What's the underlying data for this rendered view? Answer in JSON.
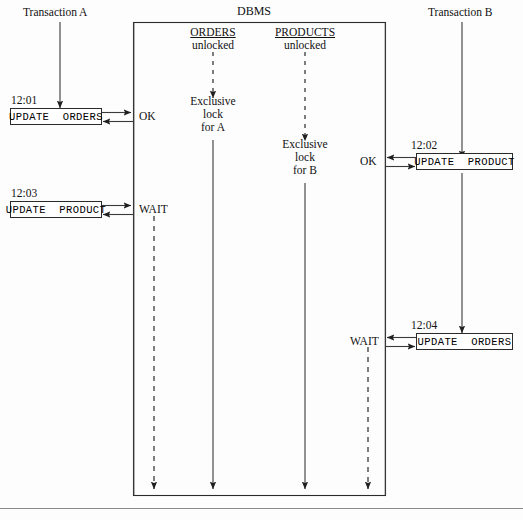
{
  "diagram": {
    "dbms_label": "DBMS",
    "actors": {
      "left": "Transaction A",
      "right": "Transaction B"
    },
    "resources": [
      {
        "name": "ORDERS",
        "initial_state": "unlocked",
        "final_state_line1": "Exclusive",
        "final_state_line2": "lock",
        "final_state_line3": "for A"
      },
      {
        "name": "PRODUCTS",
        "initial_state": "unlocked",
        "final_state_line1": "Exclusive",
        "final_state_line2": "lock",
        "final_state_line3": "for B"
      }
    ],
    "events": [
      {
        "time": "12:01",
        "statement": "UPDATE  ORDERS",
        "response": "OK",
        "side": "left"
      },
      {
        "time": "12:02",
        "statement": "UPDATE  PRODUCT",
        "response": "OK",
        "side": "right"
      },
      {
        "time": "12:03",
        "statement": "UPDATE  PRODUCT",
        "response": "WAIT",
        "side": "left"
      },
      {
        "time": "12:04",
        "statement": "UPDATE  ORDERS",
        "response": "WAIT",
        "side": "right"
      }
    ],
    "colors": {
      "stroke": "#2a2a2a",
      "text": "#111111",
      "background": "#fdfdfd",
      "rule": "#8a8a8a"
    }
  }
}
